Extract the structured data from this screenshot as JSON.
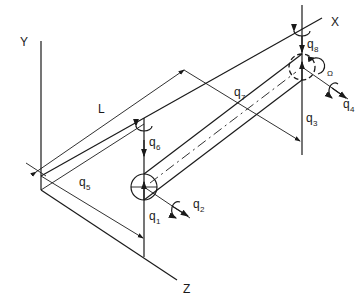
{
  "diagram": {
    "type": "isometric mechanical schematic — rotor/shaft with generalized coordinates",
    "axes": {
      "y_label": "Y",
      "x_label": "X",
      "z_label": "Z"
    },
    "dimension": {
      "length_label": "L"
    },
    "coordinates": [
      {
        "name": "q",
        "sub": "1"
      },
      {
        "name": "q",
        "sub": "2"
      },
      {
        "name": "q",
        "sub": "3"
      },
      {
        "name": "q",
        "sub": "4"
      },
      {
        "name": "q",
        "sub": "5"
      },
      {
        "name": "q",
        "sub": "6"
      },
      {
        "name": "q",
        "sub": "7"
      },
      {
        "name": "q",
        "sub": "8"
      }
    ],
    "spin_label": "Ω",
    "colors": {
      "ink": "#1a1a1a",
      "background": "#ffffff"
    }
  }
}
